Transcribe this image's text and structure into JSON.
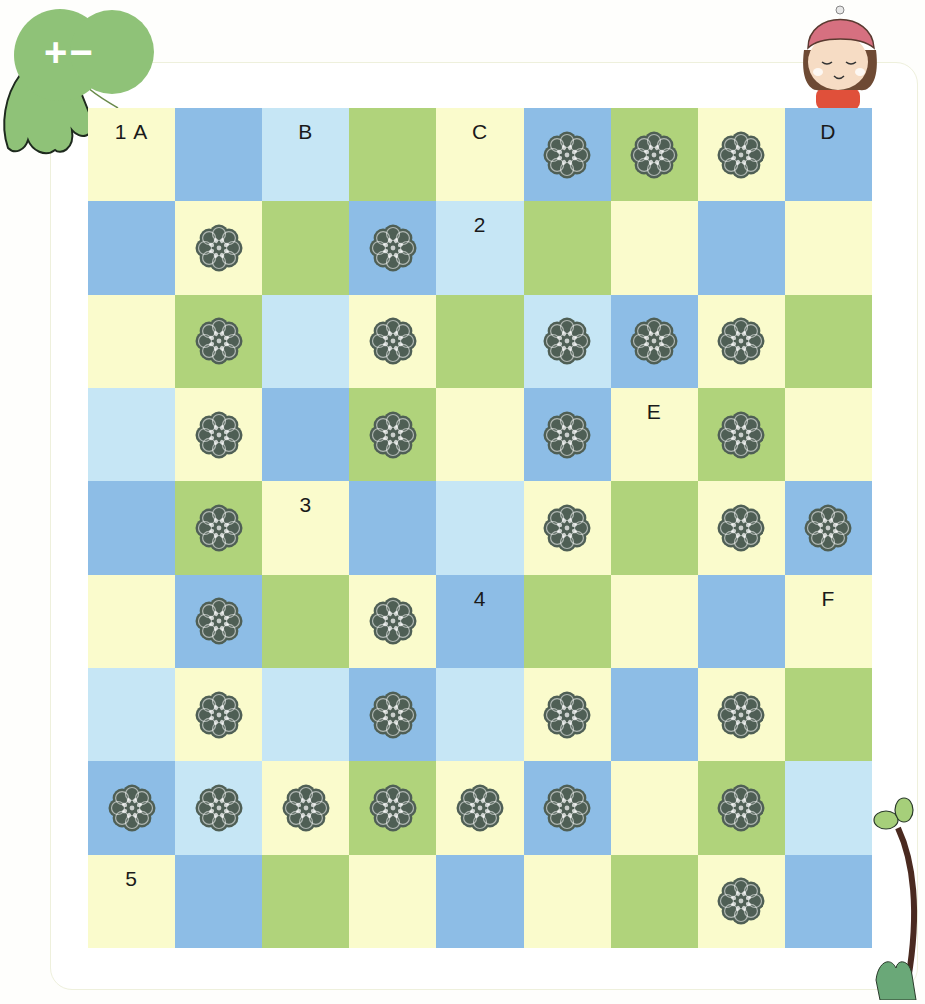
{
  "badge": {
    "text": "+−",
    "icon": "plus-minus-leaf-icon",
    "color": "#8fc278"
  },
  "mascot": {
    "icon": "girl-with-hat-icon"
  },
  "decoration": {
    "icon": "sprout-plant-icon"
  },
  "colors": {
    "Y": "#fafbcc",
    "B": "#8dbde6",
    "L": "#c6e6f5",
    "G": "#b0d37b",
    "flower_stroke": "#4f5f55"
  },
  "grid": {
    "rows": 9,
    "cols": 9,
    "legend": {
      "Y": "pale-yellow",
      "B": "blue",
      "L": "light-blue",
      "G": "green",
      "flower": "lace-rosette-icon"
    },
    "cells": [
      [
        {
          "c": "Y",
          "t": "1 A"
        },
        {
          "c": "B"
        },
        {
          "c": "L",
          "t": "B"
        },
        {
          "c": "G"
        },
        {
          "c": "Y",
          "t": "C"
        },
        {
          "c": "B",
          "f": true
        },
        {
          "c": "G",
          "f": true
        },
        {
          "c": "Y",
          "f": true
        },
        {
          "c": "B",
          "t": "D"
        }
      ],
      [
        {
          "c": "B"
        },
        {
          "c": "Y",
          "f": true
        },
        {
          "c": "G"
        },
        {
          "c": "B",
          "f": true
        },
        {
          "c": "L",
          "t": "2"
        },
        {
          "c": "G"
        },
        {
          "c": "Y"
        },
        {
          "c": "B"
        },
        {
          "c": "Y"
        }
      ],
      [
        {
          "c": "Y"
        },
        {
          "c": "G",
          "f": true
        },
        {
          "c": "L"
        },
        {
          "c": "Y",
          "f": true
        },
        {
          "c": "G"
        },
        {
          "c": "L",
          "f": true
        },
        {
          "c": "B",
          "f": true
        },
        {
          "c": "Y",
          "f": true
        },
        {
          "c": "G"
        }
      ],
      [
        {
          "c": "L"
        },
        {
          "c": "Y",
          "f": true
        },
        {
          "c": "B"
        },
        {
          "c": "G",
          "f": true
        },
        {
          "c": "Y"
        },
        {
          "c": "B",
          "f": true
        },
        {
          "c": "Y",
          "t": "E"
        },
        {
          "c": "G",
          "f": true
        },
        {
          "c": "Y"
        }
      ],
      [
        {
          "c": "B"
        },
        {
          "c": "G",
          "f": true
        },
        {
          "c": "Y",
          "t": "3"
        },
        {
          "c": "B"
        },
        {
          "c": "L"
        },
        {
          "c": "Y",
          "f": true
        },
        {
          "c": "G"
        },
        {
          "c": "Y",
          "f": true
        },
        {
          "c": "B",
          "f": true
        }
      ],
      [
        {
          "c": "Y"
        },
        {
          "c": "B",
          "f": true
        },
        {
          "c": "G"
        },
        {
          "c": "Y",
          "f": true
        },
        {
          "c": "B",
          "t": "4"
        },
        {
          "c": "G"
        },
        {
          "c": "Y"
        },
        {
          "c": "B"
        },
        {
          "c": "Y",
          "t": "F"
        }
      ],
      [
        {
          "c": "L"
        },
        {
          "c": "Y",
          "f": true
        },
        {
          "c": "L"
        },
        {
          "c": "B",
          "f": true
        },
        {
          "c": "L"
        },
        {
          "c": "Y",
          "f": true
        },
        {
          "c": "B"
        },
        {
          "c": "Y",
          "f": true
        },
        {
          "c": "G"
        }
      ],
      [
        {
          "c": "B",
          "f": true
        },
        {
          "c": "L",
          "f": true
        },
        {
          "c": "Y",
          "f": true
        },
        {
          "c": "G",
          "f": true
        },
        {
          "c": "Y",
          "f": true
        },
        {
          "c": "B",
          "f": true
        },
        {
          "c": "Y"
        },
        {
          "c": "G",
          "f": true
        },
        {
          "c": "L"
        }
      ],
      [
        {
          "c": "Y",
          "t": "5"
        },
        {
          "c": "B"
        },
        {
          "c": "G"
        },
        {
          "c": "Y"
        },
        {
          "c": "B"
        },
        {
          "c": "Y"
        },
        {
          "c": "G"
        },
        {
          "c": "Y",
          "f": true
        },
        {
          "c": "B"
        }
      ]
    ]
  }
}
